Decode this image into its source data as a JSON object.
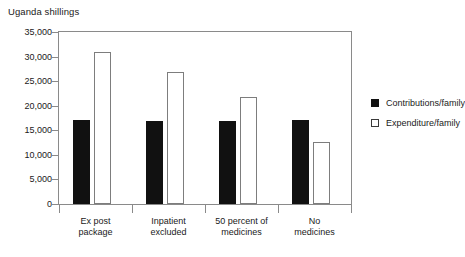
{
  "chart_data": {
    "type": "bar",
    "title": "",
    "axis_title": "Uganda shillings",
    "xlabel": "",
    "ylabel": "Uganda shillings",
    "ylim": [
      0,
      35000
    ],
    "grid": false,
    "legend_position": "right",
    "categories": [
      "Ex post package",
      "Inpatient excluded",
      "50 percent of medicines",
      "No medicines"
    ],
    "category_lines": [
      [
        "Ex post",
        "package"
      ],
      [
        "Inpatient",
        "excluded"
      ],
      [
        "50 percent of",
        "medicines"
      ],
      [
        "No",
        "medicines"
      ]
    ],
    "ytick_labels": [
      "35,000",
      "30,000",
      "25,000",
      "20,000",
      "15,000",
      "10,000",
      "5,000",
      "0"
    ],
    "ytick_values": [
      35000,
      30000,
      25000,
      20000,
      15000,
      10000,
      5000,
      0
    ],
    "series": [
      {
        "name": "Contributions/family",
        "color": "#111111",
        "values": [
          17000,
          16800,
          16800,
          17000
        ]
      },
      {
        "name": "Expenditure/family",
        "color": "#ffffff",
        "values": [
          31000,
          26800,
          21800,
          12700
        ]
      }
    ]
  },
  "legend": {
    "items": [
      {
        "label": "Contributions/family",
        "style": "dark"
      },
      {
        "label": "Expenditure/family",
        "style": "light"
      }
    ]
  }
}
